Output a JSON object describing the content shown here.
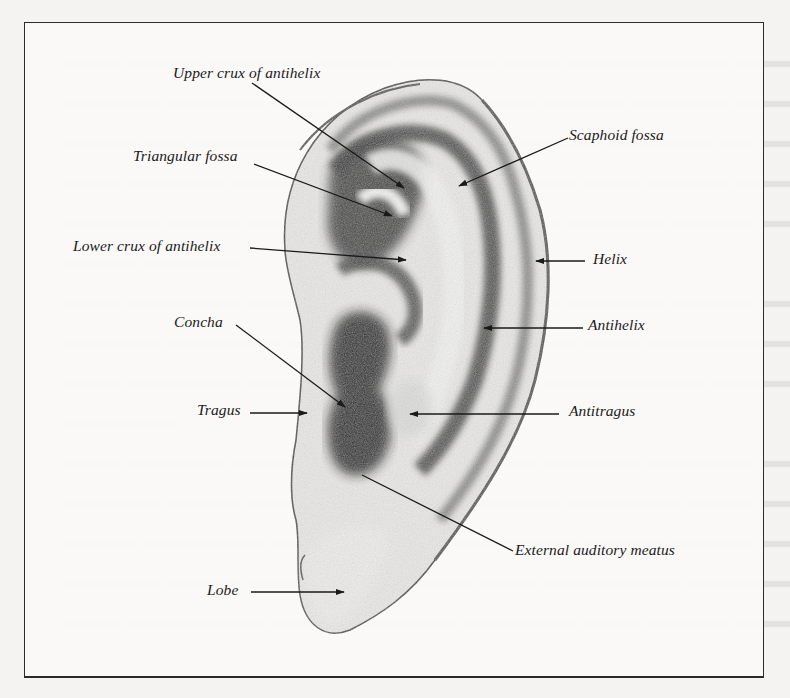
{
  "figure": {
    "border_color": "#2b2b2b",
    "ink_color": "#1a1a1a",
    "labels": [
      {
        "id": "upper-crux",
        "text": "Upper crux of antihelix"
      },
      {
        "id": "scaphoid-fossa",
        "text": "Scaphoid fossa"
      },
      {
        "id": "triangular-fossa",
        "text": "Triangular fossa"
      },
      {
        "id": "lower-crux",
        "text": "Lower crux of antihelix"
      },
      {
        "id": "helix",
        "text": "Helix"
      },
      {
        "id": "antihelix",
        "text": "Antihelix"
      },
      {
        "id": "concha",
        "text": "Concha"
      },
      {
        "id": "tragus",
        "text": "Tragus"
      },
      {
        "id": "antitragus",
        "text": "Antitragus"
      },
      {
        "id": "external-auditory-meatus",
        "text": "External auditory meatus"
      },
      {
        "id": "lobe",
        "text": "Lobe"
      }
    ]
  }
}
